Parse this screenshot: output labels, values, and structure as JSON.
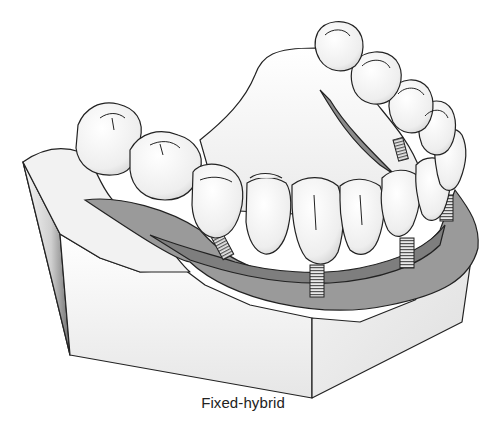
{
  "figure": {
    "caption": "Fixed-hybrid",
    "elements": {
      "teeth_count_visible": 13,
      "implants_visible": 4
    },
    "colors": {
      "background": "#ffffff",
      "outline": "#222222",
      "gingiva": "#9a9a9a",
      "gingiva_dark": "#7e7e7e",
      "tooth": "#f4f4f4",
      "cast_light": "#f2f2f2",
      "cast_shadow": "#9c9c9c"
    }
  }
}
